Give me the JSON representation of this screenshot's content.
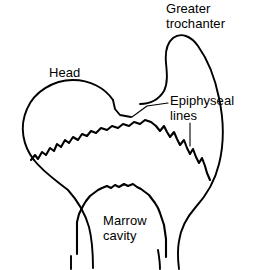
{
  "figure": {
    "type": "anatomical-line-diagram",
    "width": 259,
    "height": 270,
    "background_color": "#ffffff",
    "line_color": "#000000"
  },
  "labels": {
    "greater_trochanter": "Greater\ntrochanter",
    "head": "Head",
    "epiphyseal_lines": "Epiphyseal\nlines",
    "marrow_cavity": "Marrow\ncavity"
  },
  "annotations": [
    {
      "name": "greater-trochanter",
      "text": "Greater trochanter",
      "has_leader": false
    },
    {
      "name": "head",
      "text": "Head",
      "has_leader": false
    },
    {
      "name": "epiphyseal-lines",
      "text": "Epiphyseal lines",
      "has_leader": true,
      "leader_count": 2
    },
    {
      "name": "marrow-cavity",
      "text": "Marrow cavity",
      "has_leader": false
    }
  ],
  "paths": {
    "head_and_neck_superior": "M 113,101 C 104,88 88,80 71,80 C 52,80 34,91 27,107 C 19,125 22,145 33,159 C 42,171 57,180 68,189",
    "trochanter_and_shaft": "M 138,104 C 150,104 158,100 163,92 C 167,84 167,74 166,64 C 165,53 166,44 172,39 C 180,32 191,35 198,44 C 208,57 214,75 218,94 C 223,117 224,141 219,162 C 215,180 206,196 194,208 C 186,217 180,228 178,240 C 176,251 177,260 178,268",
    "femoral_shaft_left": "M 68,189 C 76,199 84,212 88,226 C 91,238 92,252 92,266",
    "neck_inferior_connector": "M 113,101 L 116,110 L 121,116 L 132,117",
    "epiphyseal_line_main": "M 31,159 L 35,155 L 38,158 L 42,152 L 46,154 L 49,148 L 53,150 L 56,144 L 60,146 L 64,140 L 68,142 L 72,137 L 77,139 L 81,134 L 86,135 L 90,131 L 95,132 L 100,128 L 106,129 L 111,126 L 117,127 L 122,124 L 128,125 L 133,122 L 139,123 L 144,120 L 150,121 L 155,124 L 159,130 L 163,126 L 167,131 L 170,136 L 174,132 L 177,138 L 180,144 L 184,140 L 187,147 L 190,153 L 193,149 L 196,156 L 199,162 L 202,158 L 205,165 L 207,172 L 210,178",
    "marrow_cavity_outline": "M 77,253 L 77,221 L 79,213 L 82,206 L 86,201 L 89,196 L 93,193 L 97,190 L 101,188 L 106,186 L 110,187 L 114,184 L 118,186 L 123,183 L 127,185 L 132,183 L 136,186 L 140,188 L 144,191 L 148,194 L 151,198 L 154,202 L 157,207 L 159,212 L 161,218 L 163,224 L 164,231 L 165,238 L 166,246 L 166,256",
    "marrow_cavity_right_inner": "M 157,249 C 158,255 159,261 159,267",
    "shaft_inner_left": "M 71,258 C 71,262 71,265 71,268"
  }
}
